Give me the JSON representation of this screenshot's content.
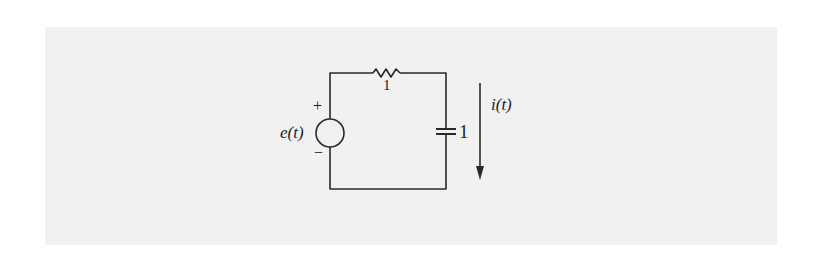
{
  "figure": {
    "background_color": "#f1f1f1",
    "line_color": "#2a2a2a",
    "source": {
      "label": "e(t)",
      "plus_sign": "+",
      "minus_sign": "−"
    },
    "resistor": {
      "value_label": "1"
    },
    "capacitor": {
      "value_label": "1"
    },
    "current": {
      "label": "i(t)",
      "direction": "down"
    }
  }
}
